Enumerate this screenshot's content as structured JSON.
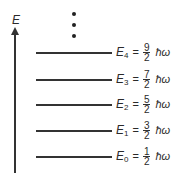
{
  "diagram": {
    "axis_label": "E",
    "continuation": "⋮",
    "unit": "ħω",
    "levels": [
      {
        "symbol": "E",
        "sub": "4",
        "eq": "=",
        "num": "9",
        "den": "2",
        "unit": "ħω",
        "y": 52
      },
      {
        "symbol": "E",
        "sub": "3",
        "eq": "=",
        "num": "7",
        "den": "2",
        "unit": "ħω",
        "y": 79
      },
      {
        "symbol": "E",
        "sub": "2",
        "eq": "=",
        "num": "5",
        "den": "2",
        "unit": "ħω",
        "y": 104
      },
      {
        "symbol": "E",
        "sub": "1",
        "eq": "=",
        "num": "3",
        "den": "2",
        "unit": "ħω",
        "y": 130
      },
      {
        "symbol": "E",
        "sub": "0",
        "eq": "=",
        "num": "1",
        "den": "2",
        "unit": "ħω",
        "y": 156
      }
    ]
  }
}
